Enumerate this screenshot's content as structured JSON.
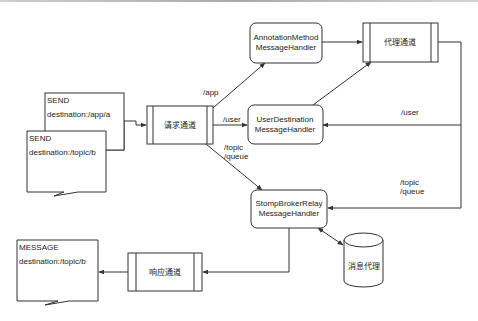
{
  "diagram": {
    "colors": {
      "stroke": "#333333",
      "fill": "#ffffff",
      "text": "#222222"
    },
    "nodes": {
      "send_app": {
        "title": "SEND",
        "detail": "destination:/app/a"
      },
      "send_topic": {
        "title": "SEND",
        "detail": "destination:/topic/b"
      },
      "request_channel": {
        "label": "请求通道"
      },
      "annotation_handler": {
        "line1": "AnnotationMethod",
        "line2": "MessageHandler"
      },
      "broker_channel": {
        "label": "代理通道"
      },
      "user_destination_handler": {
        "line1": "UserDestination",
        "line2": "MessageHandler"
      },
      "stomp_broker_relay_handler": {
        "line1": "StompBrokerRelay",
        "line2": "MessageHandler"
      },
      "message_broker": {
        "label": "消息代理"
      },
      "response_channel": {
        "label": "响应通道"
      },
      "message_out": {
        "title": "MESSAGE",
        "detail": "destination:/topic/b"
      }
    },
    "edges": {
      "app": "/app",
      "user": "/user",
      "topic": "/topic",
      "queue": "/queue",
      "user_return": "/user",
      "topic_return": "/topic",
      "queue_return": "/queue"
    }
  }
}
